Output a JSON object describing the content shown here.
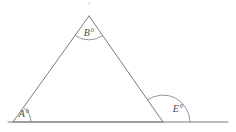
{
  "figure": {
    "type": "geometry-diagram",
    "canvas": {
      "width": 236,
      "height": 132,
      "background": "#ffffff"
    },
    "stroke_color": "#7c7c7c",
    "label_color": "#4a4a4a",
    "vertices": {
      "apex": {
        "name": "B",
        "x": 89,
        "y": 16
      },
      "bottom_left": {
        "name": "A",
        "x": 13,
        "y": 122
      },
      "bottom_right": {
        "name": "E",
        "x": 163,
        "y": 122
      }
    },
    "baseline": {
      "x1": 8,
      "y1": 122,
      "x2": 228,
      "y2": 122
    },
    "angles": [
      {
        "id": "angle-A",
        "label": "A°",
        "vertex": "bottom_left",
        "kind": "interior",
        "arc_radius": 18,
        "label_x": 24,
        "label_y": 115
      },
      {
        "id": "angle-B",
        "label": "B°",
        "vertex": "apex",
        "kind": "interior",
        "arc_radius": 24,
        "label_x": 89,
        "label_y": 34
      },
      {
        "id": "angle-E",
        "label": "E°",
        "vertex": "bottom_right",
        "kind": "exterior",
        "arc_radius": 27,
        "label_x": 178,
        "label_y": 110
      }
    ]
  }
}
